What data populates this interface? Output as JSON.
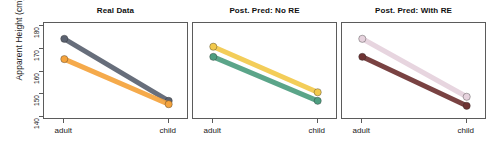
{
  "figure": {
    "ylabel": "Apparent Height (cm)",
    "xlabel": "",
    "y_ticks": [
      "140",
      "150",
      "160",
      "170",
      "180"
    ],
    "x_ticks": [
      "adult",
      "child"
    ],
    "background": "#ffffff",
    "border_color": "#5b5b5b"
  },
  "chart_data": {
    "type": "line",
    "title": "",
    "xlabel": "",
    "ylabel": "Apparent Height (cm)",
    "x": [
      "adult",
      "child"
    ],
    "xticklabels": [
      "adult",
      "child"
    ],
    "yticklabels": [
      140,
      150,
      160,
      170,
      180
    ],
    "ylim": [
      138.5,
      181.5
    ],
    "grid": false,
    "legend": "none",
    "panels": [
      {
        "title": "Real Data",
        "series": [
          {
            "name": "series-1",
            "color": "#5b6270",
            "values": [
              174.5,
              147.0
            ]
          },
          {
            "name": "series-2",
            "color": "#F5A33C",
            "values": [
              165.5,
              145.5
            ]
          }
        ]
      },
      {
        "title": "Post. Pred: No RE",
        "series": [
          {
            "name": "series-1",
            "color": "#F2C94C",
            "values": [
              171.0,
              150.8
            ]
          },
          {
            "name": "series-2",
            "color": "#4E9E80",
            "values": [
              166.5,
              147.0
            ]
          }
        ]
      },
      {
        "title": "Post. Pred: With RE",
        "series": [
          {
            "name": "series-1",
            "color": "#E6D2DD",
            "values": [
              174.5,
              148.8
            ]
          },
          {
            "name": "series-2",
            "color": "#6E3333",
            "values": [
              166.5,
              144.8
            ]
          }
        ]
      }
    ]
  }
}
